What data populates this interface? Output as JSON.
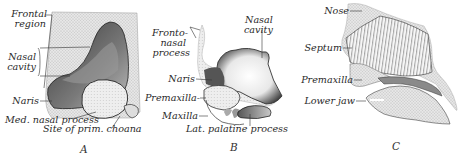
{
  "figure": {
    "panels": [
      {
        "id": "A",
        "letter": "A",
        "labels": {
          "frontal_region_1": "Frontal",
          "frontal_region_2": "region",
          "nasal_cavity_1": "Nasal",
          "nasal_cavity_2": "cavity",
          "naris": "Naris",
          "med_nasal_process": "Med. nasal process",
          "site_prim_choana": "Site of prim. choana"
        }
      },
      {
        "id": "B",
        "letter": "B",
        "labels": {
          "frontonasal_1": "Fronto-",
          "frontonasal_2": "nasal",
          "frontonasal_3": "process",
          "nasal_cavity_1": "Nasal",
          "nasal_cavity_2": "cavity",
          "naris": "Naris",
          "premaxilla": "Premaxilla-",
          "maxilla": "Maxilla",
          "lat_palatine_process": "Lat. palatine process"
        }
      },
      {
        "id": "C",
        "letter": "C",
        "labels": {
          "nose": "Nose",
          "septum": "Septum",
          "premaxilla": "Premaxilla",
          "lower_jaw": "Lower jaw"
        }
      }
    ]
  }
}
